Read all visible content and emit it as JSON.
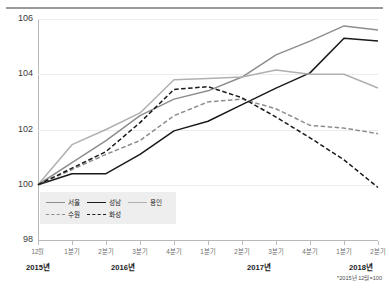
{
  "top_note": "",
  "footnote": "*2015년 12월=100",
  "chart_data": {
    "type": "line",
    "title": "",
    "subtitle": "",
    "xlabel": "",
    "ylabel": "",
    "ylim": [
      98,
      106
    ],
    "yticks": [
      98,
      100,
      102,
      104,
      106
    ],
    "ytick_labels": [
      "98",
      "100",
      "102",
      "104",
      "106"
    ],
    "grid": true,
    "legend_position": "inside-bottom-left",
    "note": "*2015년 12월=100",
    "x": [
      "12월",
      "1분기",
      "2분기",
      "3분기",
      "4분기",
      "1분기",
      "2분기",
      "3분기",
      "4분기",
      "1분기",
      "2분기"
    ],
    "categories": [
      "12월",
      "1분기",
      "2분기",
      "3분기",
      "4분기",
      "1분기",
      "2분기",
      "3분기",
      "4분기",
      "1분기",
      "2분기"
    ],
    "year_groups": [
      {
        "label": "2015년",
        "start_index": 0,
        "end_index": 0
      },
      {
        "label": "2016년",
        "start_index": 1,
        "end_index": 4
      },
      {
        "label": "2017년",
        "start_index": 5,
        "end_index": 8
      },
      {
        "label": "2018년",
        "start_index": 9,
        "end_index": 10
      }
    ],
    "series": [
      {
        "name": "서울",
        "style": "solid",
        "color": "#8d8d8d",
        "values": [
          100.0,
          100.8,
          101.6,
          102.5,
          103.1,
          103.4,
          103.9,
          104.7,
          105.2,
          105.75,
          105.6
        ]
      },
      {
        "name": "성남",
        "style": "solid",
        "color": "#1a1a1a",
        "values": [
          100.0,
          100.4,
          100.4,
          101.1,
          101.95,
          102.3,
          102.9,
          103.5,
          104.05,
          105.3,
          105.2
        ]
      },
      {
        "name": "용인",
        "style": "solid",
        "color": "#b0b0b0",
        "values": [
          100.0,
          101.45,
          102.0,
          102.6,
          103.8,
          103.85,
          103.9,
          104.15,
          104.0,
          104.0,
          103.5
        ]
      },
      {
        "name": "수원",
        "style": "dashed",
        "color": "#8d8d8d",
        "values": [
          100.0,
          100.55,
          101.1,
          101.6,
          102.5,
          103.0,
          103.1,
          102.75,
          102.15,
          102.05,
          101.85
        ]
      },
      {
        "name": "화성",
        "style": "dashed",
        "color": "#1a1a1a",
        "values": [
          100.0,
          100.6,
          101.2,
          102.25,
          103.45,
          103.55,
          103.15,
          102.45,
          101.7,
          100.9,
          99.9
        ]
      }
    ],
    "legend": [
      {
        "name": "서울",
        "style": "solid",
        "color": "#8d8d8d"
      },
      {
        "name": "성남",
        "style": "solid",
        "color": "#1a1a1a"
      },
      {
        "name": "용인",
        "style": "solid",
        "color": "#b0b0b0"
      },
      {
        "name": "수원",
        "style": "dashed",
        "color": "#8d8d8d"
      },
      {
        "name": "화성",
        "style": "dashed",
        "color": "#1a1a1a"
      }
    ]
  }
}
